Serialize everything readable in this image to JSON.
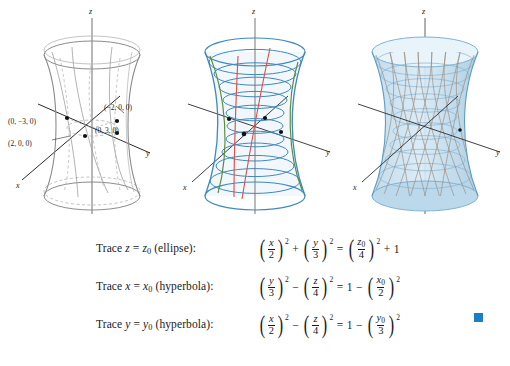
{
  "figures": [
    {
      "name": "wireframe-hyperboloid",
      "caption": "",
      "axes": {
        "z": "z",
        "y": "y",
        "x": "x"
      },
      "points": [
        {
          "label": "(0, −3, 0)",
          "x": 8,
          "y": 124
        },
        {
          "label": "(2, 0, 0)",
          "x": 8,
          "y": 146
        },
        {
          "label": "(−2, 0, 0)",
          "x": 104,
          "y": 110
        },
        {
          "label": "(0, 3, 0)",
          "x": 95,
          "y": 131
        }
      ]
    },
    {
      "name": "trace-curves-hyperboloid",
      "caption": "",
      "axes": {
        "z": "z",
        "y": "y",
        "x": "x"
      },
      "points": []
    },
    {
      "name": "shaded-mesh-hyperboloid",
      "caption": "",
      "axes": {
        "z": "z",
        "y": "y",
        "x": "x"
      },
      "points": []
    }
  ],
  "traces": [
    {
      "label_prefix": "Trace",
      "var": "z",
      "eq": "=",
      "value": "z",
      "value_sub": "0",
      "kind": "(ellipse):",
      "equation": {
        "terms": [
          {
            "type": "fracpow",
            "num": "x",
            "den": "2",
            "exp": "2"
          },
          {
            "type": "op",
            "text": "+"
          },
          {
            "type": "fracpow",
            "num": "y",
            "den": "3",
            "exp": "2"
          },
          {
            "type": "op",
            "text": "="
          },
          {
            "type": "fracpow",
            "num": "z",
            "num_sub": "0",
            "den": "4",
            "exp": "2"
          },
          {
            "type": "op",
            "text": "+"
          },
          {
            "type": "plain",
            "text": "1"
          }
        ]
      }
    },
    {
      "label_prefix": "Trace",
      "var": "x",
      "eq": "=",
      "value": "x",
      "value_sub": "0",
      "kind": "(hyperbola):",
      "equation": {
        "terms": [
          {
            "type": "fracpow",
            "num": "y",
            "den": "3",
            "exp": "2"
          },
          {
            "type": "op",
            "text": "−"
          },
          {
            "type": "fracpow",
            "num": "z",
            "den": "4",
            "exp": "2"
          },
          {
            "type": "op",
            "text": "="
          },
          {
            "type": "plain",
            "text": "1"
          },
          {
            "type": "op",
            "text": "−"
          },
          {
            "type": "fracpow",
            "num": "x",
            "num_sub": "0",
            "den": "2",
            "exp": "2"
          }
        ]
      }
    },
    {
      "label_prefix": "Trace",
      "var": "y",
      "eq": "=",
      "value": "y",
      "value_sub": "0",
      "kind": "(hyperbola):",
      "equation": {
        "terms": [
          {
            "type": "fracpow",
            "num": "x",
            "den": "2",
            "exp": "2"
          },
          {
            "type": "op",
            "text": "−"
          },
          {
            "type": "fracpow",
            "num": "z",
            "den": "4",
            "exp": "2"
          },
          {
            "type": "op",
            "text": "="
          },
          {
            "type": "plain",
            "text": "1"
          },
          {
            "type": "op",
            "text": "−"
          },
          {
            "type": "fracpow",
            "num": "y",
            "num_sub": "0",
            "den": "3",
            "exp": "2"
          }
        ]
      }
    }
  ],
  "end_marker": {
    "name": "section-end-square",
    "color": "#1a7fc4"
  },
  "colors": {
    "wireframe_gray": "#8c8c8c",
    "trace_blue": "#3f89bd",
    "trace_red": "#d9534f",
    "trace_green": "#5c8c3a",
    "surface_fill": "#cfe4f2",
    "axis_black": "#2b2b2b",
    "accent": "#1a7fc4"
  }
}
